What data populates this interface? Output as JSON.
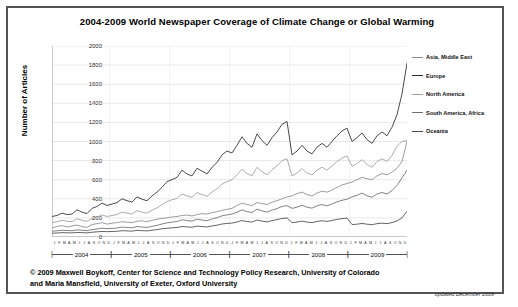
{
  "chart": {
    "title": "2004-2009 World Newspaper Coverage of Climate Change or Global Warming",
    "ylabel": "Number of Articles",
    "updated_note": "updated December 2009",
    "credit_line_1": "© 2009 Maxwell Boykoff, Center for Science and Technology Policy Research, University of Colorado",
    "credit_line_2": "and Maria Mansfield, University of Exeter, Oxford University"
  },
  "chart_data": {
    "type": "line",
    "title": "2004-2009 World Newspaper Coverage of Climate Change or Global Warming",
    "xlabel": "",
    "ylabel": "Number of Articles",
    "ylim": [
      0,
      2000
    ],
    "ytick_step": 200,
    "yticks": [
      0,
      200,
      400,
      600,
      800,
      1000,
      1200,
      1400,
      1600,
      1800,
      2000
    ],
    "grid": true,
    "legend_position": "right",
    "years": [
      "2004",
      "2005",
      "2006",
      "2007",
      "2008",
      "2009"
    ],
    "month_initials": [
      "J",
      "F",
      "M",
      "A",
      "M",
      "J",
      "J",
      "A",
      "S",
      "O",
      "N",
      "D"
    ],
    "x": [
      "2004-01",
      "2004-02",
      "2004-03",
      "2004-04",
      "2004-05",
      "2004-06",
      "2004-07",
      "2004-08",
      "2004-09",
      "2004-10",
      "2004-11",
      "2004-12",
      "2005-01",
      "2005-02",
      "2005-03",
      "2005-04",
      "2005-05",
      "2005-06",
      "2005-07",
      "2005-08",
      "2005-09",
      "2005-10",
      "2005-11",
      "2005-12",
      "2006-01",
      "2006-02",
      "2006-03",
      "2006-04",
      "2006-05",
      "2006-06",
      "2006-07",
      "2006-08",
      "2006-09",
      "2006-10",
      "2006-11",
      "2006-12",
      "2007-01",
      "2007-02",
      "2007-03",
      "2007-04",
      "2007-05",
      "2007-06",
      "2007-07",
      "2007-08",
      "2007-09",
      "2007-10",
      "2007-11",
      "2007-12",
      "2008-01",
      "2008-02",
      "2008-03",
      "2008-04",
      "2008-05",
      "2008-06",
      "2008-07",
      "2008-08",
      "2008-09",
      "2008-10",
      "2008-11",
      "2008-12",
      "2009-01",
      "2009-02",
      "2009-03",
      "2009-04",
      "2009-05",
      "2009-06",
      "2009-07",
      "2009-08",
      "2009-09",
      "2009-10",
      "2009-11",
      "2009-12"
    ],
    "series": [
      {
        "name": "Asia, Middle East",
        "color": "#8c8c8c",
        "values": [
          95,
          110,
          120,
          105,
          115,
          125,
          110,
          100,
          130,
          140,
          150,
          135,
          145,
          150,
          160,
          155,
          150,
          165,
          170,
          160,
          175,
          185,
          195,
          200,
          210,
          215,
          225,
          230,
          220,
          235,
          245,
          240,
          255,
          265,
          280,
          290,
          300,
          330,
          355,
          340,
          330,
          360,
          350,
          340,
          365,
          380,
          400,
          420,
          430,
          455,
          470,
          445,
          430,
          460,
          480,
          470,
          490,
          520,
          545,
          560,
          575,
          600,
          625,
          610,
          600,
          640,
          665,
          650,
          680,
          720,
          790,
          1000
        ]
      },
      {
        "name": "Europe",
        "color": "#2b2b2b",
        "values": [
          215,
          225,
          250,
          235,
          240,
          285,
          260,
          245,
          300,
          320,
          355,
          330,
          345,
          360,
          400,
          380,
          365,
          420,
          395,
          380,
          430,
          470,
          520,
          580,
          600,
          625,
          700,
          660,
          640,
          720,
          690,
          660,
          730,
          780,
          860,
          900,
          880,
          960,
          1050,
          980,
          940,
          1080,
          1010,
          960,
          1040,
          1100,
          1180,
          1210,
          860,
          900,
          960,
          900,
          870,
          940,
          980,
          940,
          1000,
          1060,
          1110,
          1140,
          1000,
          1040,
          1090,
          1020,
          980,
          1060,
          1100,
          1060,
          1150,
          1280,
          1500,
          1820
        ]
      },
      {
        "name": "North America",
        "color": "#9e9e9e",
        "values": [
          150,
          160,
          175,
          165,
          160,
          190,
          175,
          165,
          195,
          210,
          230,
          215,
          225,
          235,
          260,
          250,
          240,
          275,
          260,
          250,
          280,
          305,
          340,
          370,
          390,
          405,
          450,
          430,
          415,
          465,
          445,
          425,
          470,
          505,
          555,
          580,
          600,
          650,
          710,
          665,
          640,
          730,
          685,
          650,
          705,
          745,
          800,
          820,
          640,
          670,
          715,
          670,
          650,
          700,
          730,
          700,
          745,
          790,
          825,
          850,
          740,
          770,
          810,
          760,
          730,
          790,
          820,
          790,
          855,
          950,
          1000,
          1010
        ]
      },
      {
        "name": "South America, Africa",
        "color": "#6e6e6e",
        "values": [
          60,
          65,
          70,
          68,
          66,
          75,
          70,
          66,
          78,
          84,
          92,
          88,
          90,
          94,
          104,
          100,
          96,
          110,
          104,
          100,
          112,
          122,
          136,
          148,
          156,
          162,
          180,
          172,
          166,
          186,
          178,
          170,
          188,
          202,
          222,
          232,
          240,
          260,
          284,
          266,
          256,
          292,
          274,
          260,
          282,
          298,
          320,
          328,
          300,
          312,
          332,
          312,
          302,
          326,
          340,
          326,
          346,
          368,
          384,
          396,
          420,
          436,
          460,
          432,
          416,
          450,
          466,
          450,
          486,
          540,
          620,
          700
        ]
      },
      {
        "name": "Oceania",
        "color": "#4a4a4a",
        "values": [
          40,
          42,
          46,
          44,
          43,
          48,
          46,
          43,
          50,
          54,
          58,
          56,
          58,
          60,
          66,
          64,
          61,
          70,
          66,
          64,
          71,
          77,
          86,
          92,
          96,
          100,
          110,
          106,
          102,
          114,
          110,
          105,
          116,
          124,
          136,
          142,
          146,
          158,
          172,
          162,
          156,
          178,
          166,
          158,
          172,
          182,
          194,
          200,
          150,
          156,
          166,
          156,
          151,
          163,
          170,
          163,
          173,
          184,
          192,
          198,
          130,
          134,
          142,
          134,
          129,
          140,
          145,
          140,
          151,
          168,
          200,
          270
        ]
      }
    ]
  }
}
